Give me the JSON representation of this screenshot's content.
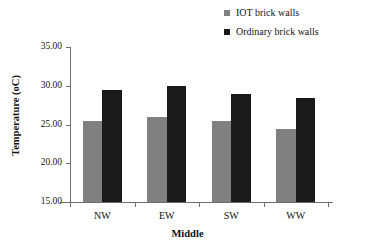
{
  "chart_data": {
    "type": "bar",
    "title": "",
    "xlabel": "Middle",
    "ylabel": "Temperature (oC)",
    "categories": [
      "NW",
      "EW",
      "SW",
      "WW"
    ],
    "series": [
      {
        "name": "IOT brick walls",
        "color": "#808080",
        "values": [
          25.4,
          26.0,
          25.4,
          24.4
        ]
      },
      {
        "name": "Ordinary brick walls",
        "color": "#1a1a1a",
        "values": [
          29.5,
          30.0,
          28.9,
          28.4
        ]
      }
    ],
    "ylim": [
      15.0,
      35.0
    ],
    "ytick_values": [
      35.0,
      30.0,
      25.0,
      20.0,
      15.0
    ],
    "ytick_labels": [
      "35.00",
      "30.00",
      "25.00",
      "20.00",
      "15.00"
    ],
    "grid": false,
    "legend_position": "top-right",
    "axis_color": "#6e6e6e"
  },
  "legend": {
    "items": [
      {
        "label": "IOT brick walls",
        "marker": "legend-swatch-gray"
      },
      {
        "label": "Ordinary brick walls",
        "marker": "legend-swatch-black"
      }
    ]
  }
}
